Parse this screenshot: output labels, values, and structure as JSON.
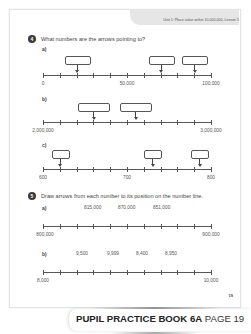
{
  "header": {
    "lesson": "Unit 1: Place value within 10,000,000, Lesson 5"
  },
  "question4": {
    "number": "4",
    "text": "What numbers are the arrows pointing to?",
    "parts": [
      {
        "label": "a)",
        "start": "0",
        "mid": "50,000",
        "end": "100,000",
        "ticks": 11,
        "arrows_at_tick": [
          2,
          7,
          9
        ]
      },
      {
        "label": "b)",
        "start": "2,000,000",
        "end": "3,000,000",
        "ticks": 11,
        "arrows_at_tick": [
          3,
          5.5
        ]
      },
      {
        "label": "c)",
        "start": "600",
        "mid": "700",
        "end": "800",
        "ticks": 11,
        "arrows_at_tick": [
          1,
          6.5,
          9.3
        ]
      }
    ]
  },
  "question5": {
    "number": "5",
    "text": "Draw arrows from each number to its position on the number line.",
    "parts": [
      {
        "label": "a)",
        "values": [
          "815,000",
          "870,000",
          "851,000"
        ],
        "start": "800,000",
        "end": "900,000",
        "ticks": 11
      },
      {
        "label": "b)",
        "values": [
          "9,500",
          "9,999",
          "8,400",
          "8,950"
        ],
        "start": "8,000",
        "end": "10,000",
        "ticks": 11
      }
    ]
  },
  "page_number": "19",
  "footer": {
    "book": "PUPIL PRACTICE BOOK 6A",
    "page": "PAGE 19"
  }
}
